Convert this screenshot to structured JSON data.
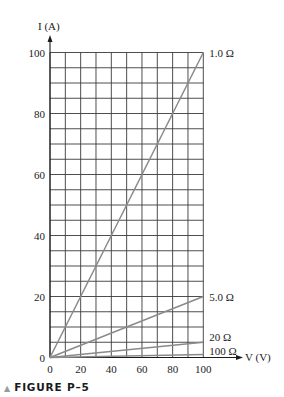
{
  "chart_data": {
    "type": "line",
    "title": "",
    "xlabel": "V (V)",
    "ylabel": "I (A)",
    "xlim": [
      0,
      100
    ],
    "ylim": [
      0,
      100
    ],
    "x_ticks": [
      0,
      20,
      40,
      60,
      80,
      100
    ],
    "y_ticks": [
      0,
      20,
      40,
      60,
      80,
      100
    ],
    "grid": {
      "on": true,
      "x_step": 10,
      "y_step": 5
    },
    "legend_position": "inline-right",
    "series": [
      {
        "name": "1.0 Ω",
        "resistance_ohm": 1.0,
        "x": [
          0,
          100
        ],
        "values": [
          0,
          100
        ]
      },
      {
        "name": "5.0 Ω",
        "resistance_ohm": 5.0,
        "x": [
          0,
          100
        ],
        "values": [
          0,
          20
        ]
      },
      {
        "name": "20 Ω",
        "resistance_ohm": 20,
        "x": [
          0,
          100
        ],
        "values": [
          0,
          5
        ]
      },
      {
        "name": "100 Ω",
        "resistance_ohm": 100,
        "x": [
          0,
          100
        ],
        "values": [
          0,
          1
        ]
      }
    ]
  },
  "labels": {
    "y_axis": "I (A)",
    "x_axis": "V (V)",
    "y_origin": "0",
    "x_origin": "0"
  },
  "caption": {
    "marker": "▲",
    "text": "FIGURE P–5"
  },
  "colors": {
    "grid": "#3a3a3a",
    "series": "#8a8a8a",
    "text": "#1a1a1a",
    "caption_marker": "#9a9a9a"
  }
}
